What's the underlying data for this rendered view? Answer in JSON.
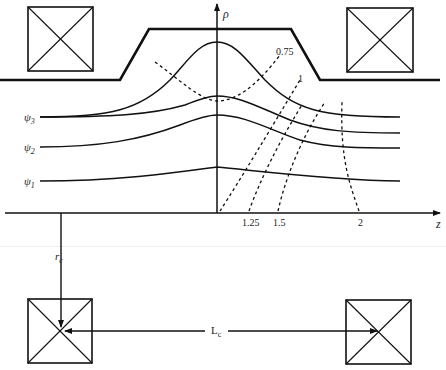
{
  "diagram": {
    "axes": {
      "vertical_label": "ρ",
      "horizontal_label": "z"
    },
    "flux_lines": [
      {
        "label": "ψ3"
      },
      {
        "label": "ψ2"
      },
      {
        "label": "ψ1"
      }
    ],
    "flux_line_labels": {
      "psi3_base": "ψ",
      "psi3_sub": "3",
      "psi2_base": "ψ",
      "psi2_sub": "2",
      "psi1_base": "ψ",
      "psi1_sub": "1"
    },
    "contours": [
      {
        "label": "0.75"
      },
      {
        "label": "1"
      },
      {
        "label": "1.25"
      },
      {
        "label": "1.5"
      },
      {
        "label": "2"
      }
    ],
    "coil_radius": {
      "base": "r",
      "sub": "c"
    },
    "coil_separation": {
      "base": "L",
      "sub": "c"
    },
    "coils": [
      "top-left",
      "top-right",
      "bottom-left",
      "bottom-right"
    ],
    "colors": {
      "line": "#111111",
      "background": "#ffffff"
    }
  }
}
